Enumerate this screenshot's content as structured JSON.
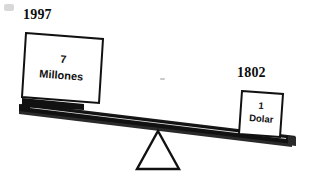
{
  "figure": {
    "kind": "balance-scale-illustration",
    "background_color": "#ffffff",
    "ink_color": "#111111"
  },
  "left_side": {
    "year_label": "1997",
    "block_line1": "7",
    "block_line2": "Millones",
    "position": "down"
  },
  "right_side": {
    "year_label": "1802",
    "block_line1": "1",
    "block_line2": "Dolar",
    "position": "up"
  },
  "fulcrum": {
    "shape": "triangle"
  }
}
